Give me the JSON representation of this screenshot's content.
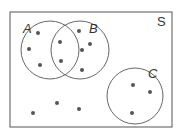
{
  "diagram": {
    "type": "venn",
    "universe_label": "S",
    "sets": [
      {
        "label": "A",
        "cx": 50,
        "cy": 50,
        "r": 29,
        "label_x": 23,
        "label_y": 33
      },
      {
        "label": "B",
        "cx": 80,
        "cy": 50,
        "r": 29,
        "label_x": 89,
        "label_y": 33
      },
      {
        "label": "C",
        "cx": 135,
        "cy": 96,
        "r": 28,
        "label_x": 148,
        "label_y": 78
      }
    ],
    "universe_rect": {
      "x": 10,
      "y": 12,
      "w": 162,
      "h": 115,
      "label_x": 157,
      "label_y": 26
    },
    "points": {
      "A_only": [
        [
          38,
          33
        ],
        [
          29,
          49
        ],
        [
          40,
          65
        ]
      ],
      "A_and_B": [
        [
          60,
          42
        ],
        [
          61,
          61
        ]
      ],
      "B_only": [
        [
          79,
          31
        ],
        [
          90,
          44
        ],
        [
          82,
          50
        ],
        [
          82,
          70
        ]
      ],
      "C_only": [
        [
          133,
          85
        ],
        [
          150,
          92
        ],
        [
          132,
          113
        ]
      ],
      "outside": [
        [
          33,
          113
        ],
        [
          57,
          103
        ],
        [
          79,
          109
        ]
      ]
    },
    "counts": {
      "A_only": 3,
      "A_and_B": 2,
      "B_only": 4,
      "C": 3,
      "outside": 3
    },
    "colors": {
      "stroke": "#555555",
      "dot": "#555555",
      "text": "#333333"
    }
  }
}
